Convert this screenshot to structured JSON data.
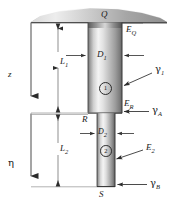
{
  "figure": {
    "title_point_top": "Q",
    "point_step": "R",
    "point_bottom": "S",
    "axis_z": "z",
    "axis_eta": "η",
    "length_upper": "L",
    "length_upper_sub": "1",
    "length_lower": "L",
    "length_lower_sub": "2",
    "dia_upper": "D",
    "dia_upper_sub": "1",
    "dia_lower": "D",
    "dia_lower_sub": "2",
    "mod_top": "E",
    "mod_top_sub": "Q",
    "mod_step": "E",
    "mod_step_sub": "R",
    "mod_lower": "E",
    "mod_lower_sub": "2",
    "gamma_upper": "γ",
    "gamma_upper_sub": "1",
    "gamma_a": "γ",
    "gamma_a_sub": "A",
    "gamma_b": "γ",
    "gamma_b_sub": "B",
    "segment_one": "①",
    "segment_one_plain": "1",
    "segment_two": "②",
    "segment_two_plain": "2",
    "colors": {
      "line": "#2b2b2b",
      "thin_line": "#8a8a8a",
      "metal_light": "#f2f2f2",
      "metal_mid": "#b9b9b9",
      "metal_dark": "#6e6e6e",
      "ceiling_light": "#efefef",
      "ceiling_dark": "#9a9a9a",
      "text": "#1a1a1a"
    },
    "geometry": {
      "ceiling_y": 22,
      "step_y": 113,
      "bottom_y": 187,
      "upper_left_x": 88,
      "upper_right_x": 122,
      "lower_left_x": 97,
      "lower_right_x": 115
    }
  }
}
